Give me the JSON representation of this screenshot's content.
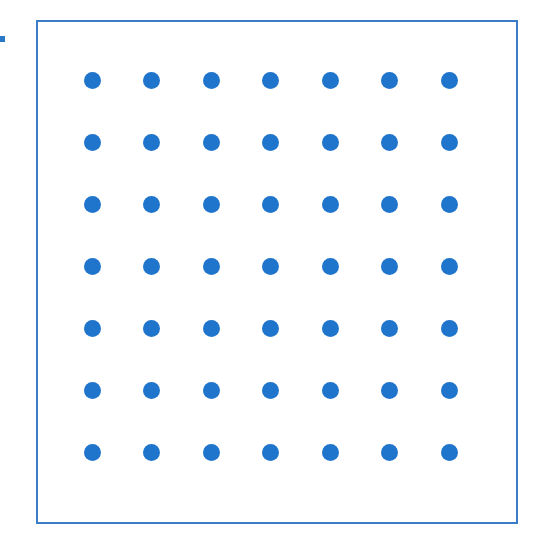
{
  "diagram": {
    "type": "dot-grid",
    "rows": 7,
    "columns": 7,
    "dot_color": "#1f74cb",
    "border_color": "#3a7cc6",
    "origin": {
      "x": 92,
      "y": 80
    },
    "spacing": {
      "x": 59.5,
      "y": 62
    }
  }
}
